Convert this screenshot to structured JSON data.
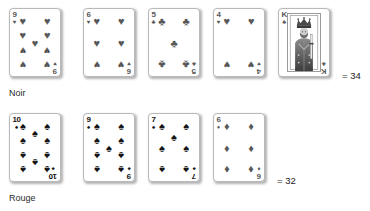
{
  "rows": [
    {
      "label": "Noir",
      "sum_text": "= 34",
      "tone": "gray",
      "cards": [
        {
          "rank": "9",
          "suit": "hearts",
          "suit_glyph": "♥",
          "count": 9,
          "face": false
        },
        {
          "rank": "6",
          "suit": "hearts",
          "suit_glyph": "♥",
          "count": 6,
          "face": false
        },
        {
          "rank": "5",
          "suit": "clubs",
          "suit_glyph": "♣",
          "count": 5,
          "face": false
        },
        {
          "rank": "4",
          "suit": "hearts",
          "suit_glyph": "♥",
          "count": 4,
          "face": false
        },
        {
          "rank": "K",
          "suit": "clubs",
          "suit_glyph": "♣",
          "count": 0,
          "face": true
        }
      ]
    },
    {
      "label": "Rouge",
      "sum_text": "= 32",
      "tone": "dark",
      "cards": [
        {
          "rank": "10",
          "suit": "spades",
          "suit_glyph": "♠",
          "count": 10,
          "face": false,
          "tone": "dark"
        },
        {
          "rank": "9",
          "suit": "spades",
          "suit_glyph": "♠",
          "count": 9,
          "face": false,
          "tone": "dark"
        },
        {
          "rank": "7",
          "suit": "spades",
          "suit_glyph": "♠",
          "count": 7,
          "face": false,
          "tone": "dark"
        },
        {
          "rank": "6",
          "suit": "diamonds",
          "suit_glyph": "♦",
          "count": 6,
          "face": false,
          "tone": "gray"
        }
      ]
    }
  ],
  "colors": {
    "pip_gray": "#585858",
    "pip_dark": "#141414",
    "card_border": "#b9b9b9",
    "card_face": "#ffffff",
    "text": "#1b1b1b"
  }
}
